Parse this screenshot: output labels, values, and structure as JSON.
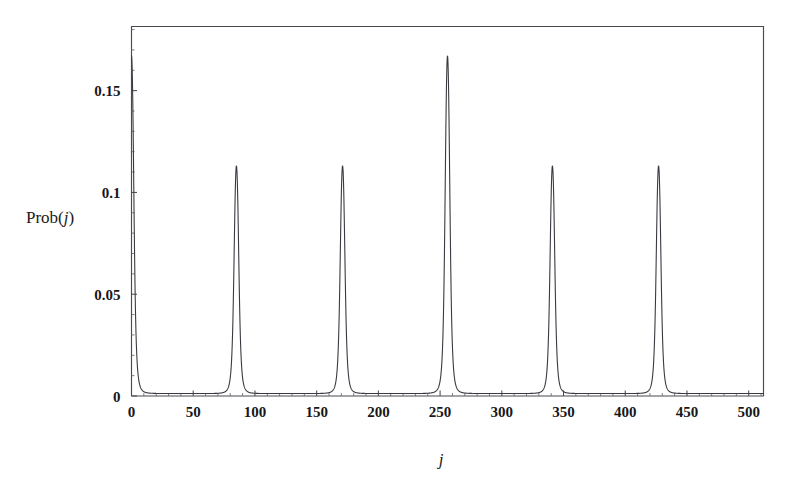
{
  "figure": {
    "background_color": "#ffffff",
    "line_color": "#3a3a42",
    "axis_color": "#4a4a52",
    "text_color": "#1a1a1a"
  },
  "ylabel_parts": {
    "base": "Prob(",
    "variable": "j",
    "close": ")"
  },
  "xlabel_text": "j",
  "chart_data": {
    "type": "line",
    "title": "",
    "xlabel": "j",
    "ylabel": "Prob(j)",
    "xlim": [
      0,
      512
    ],
    "ylim": [
      0,
      0.1815
    ],
    "grid": false,
    "legend": false,
    "legend_position": "none",
    "x_ticks": [
      0,
      50,
      100,
      150,
      200,
      250,
      300,
      350,
      400,
      450,
      500
    ],
    "x_tick_labels": [
      "0",
      "50",
      "100",
      "150",
      "200",
      "250",
      "300",
      "350",
      "400",
      "450",
      "500"
    ],
    "x_minor_tick_step": 10,
    "y_ticks": [
      0,
      0.05,
      0.1,
      0.15
    ],
    "y_tick_labels": [
      "0",
      "0.05",
      "0.1",
      "0.15"
    ],
    "y_minor_tick_step": 0.01,
    "baseline_value": 0.0012,
    "peak_period": 85.33,
    "peaks": [
      {
        "j": 0,
        "value": 0.167,
        "width": 2.2
      },
      {
        "j": 85,
        "value": 0.113,
        "width": 2.2
      },
      {
        "j": 171,
        "value": 0.113,
        "width": 2.2
      },
      {
        "j": 256,
        "value": 0.167,
        "width": 2.2
      },
      {
        "j": 341,
        "value": 0.113,
        "width": 2.2
      },
      {
        "j": 427,
        "value": 0.113,
        "width": 2.2
      }
    ],
    "series": [
      {
        "name": "Prob(j)",
        "x": [
          0,
          85,
          171,
          256,
          341,
          427
        ],
        "values": [
          0.167,
          0.113,
          0.113,
          0.167,
          0.113,
          0.113
        ]
      }
    ]
  }
}
